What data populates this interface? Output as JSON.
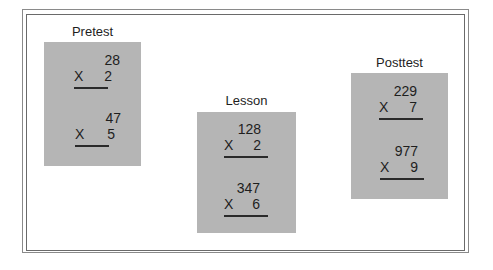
{
  "panels": [
    {
      "title": "Pretest",
      "problems": [
        {
          "multiplicand": "28",
          "operator": "X",
          "multiplier": "2"
        },
        {
          "multiplicand": "47",
          "operator": "X",
          "multiplier": "5"
        }
      ]
    },
    {
      "title": "Lesson",
      "problems": [
        {
          "multiplicand": "128",
          "operator": "X",
          "multiplier": "2"
        },
        {
          "multiplicand": "347",
          "operator": "X",
          "multiplier": "6"
        }
      ]
    },
    {
      "title": "Posttest",
      "problems": [
        {
          "multiplicand": "229",
          "operator": "X",
          "multiplier": "7"
        },
        {
          "multiplicand": "977",
          "operator": "X",
          "multiplier": "9"
        }
      ]
    }
  ],
  "colors": {
    "panel": "#b5b5b5",
    "frame": "#7a7a7a",
    "text": "#1e1e1e"
  }
}
